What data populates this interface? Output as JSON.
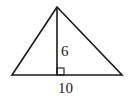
{
  "diagram": {
    "type": "triangle-with-altitude",
    "stroke_color": "#1a1a1a",
    "background": "#ffffff",
    "vertices": {
      "apex": [
        57,
        7
      ],
      "left": [
        12,
        75
      ],
      "right": [
        122,
        75
      ]
    },
    "altitude": {
      "from": [
        57,
        7
      ],
      "to": [
        57,
        75
      ]
    },
    "right_angle_marker": {
      "x": 57,
      "y": 68,
      "size": 7
    },
    "labels": {
      "height": "6",
      "base": "10"
    }
  }
}
